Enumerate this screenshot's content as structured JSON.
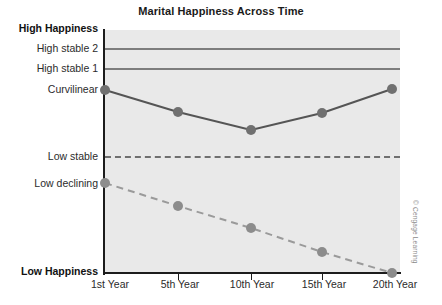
{
  "figure": {
    "title": "Marital Happiness Across Time",
    "credit": "© Cengage Learning"
  },
  "axes": {
    "y_top_label": "High Happiness",
    "y_bottom_label": "Low Happiness",
    "y_category_labels": [
      "High stable 2",
      "High stable 1",
      "Curvilinear",
      "Low stable",
      "Low declining"
    ],
    "x_tick_labels": [
      "1st Year",
      "5th Year",
      "10th Year",
      "15th Year",
      "20th Year"
    ]
  },
  "colors": {
    "plot_background": "#e9e9e9",
    "axis": "#1c1c1c",
    "flat_line": "#7d7d7d",
    "curvilinear_line": "#555555",
    "curvilinear_marker": "#707070",
    "declining_line": "#9a9a9a",
    "declining_marker": "#8c8c8c",
    "title_text": "#1a1a1a",
    "label_text": "#2b2b2b"
  },
  "chart_data": {
    "type": "line",
    "title": "Marital Happiness Across Time",
    "xlabel": "",
    "ylabel": "",
    "grid": false,
    "legend": "inline-left-axis",
    "x": [
      "1st Year",
      "5th Year",
      "10th Year",
      "15th Year",
      "20th Year"
    ],
    "ylim": [
      0,
      100
    ],
    "y_axis_anchors": [
      {
        "label": "High Happiness",
        "value": 100
      },
      {
        "label": "High stable 2",
        "value": 92
      },
      {
        "label": "High stable 1",
        "value": 84
      },
      {
        "label": "Curvilinear",
        "value": 75
      },
      {
        "label": "Low stable",
        "value": 47
      },
      {
        "label": "Low declining",
        "value": 37
      },
      {
        "label": "Low Happiness",
        "value": 0
      }
    ],
    "series": [
      {
        "name": "High stable 2",
        "style": "solid",
        "markers": false,
        "values": [
          92,
          92,
          92,
          92,
          92
        ]
      },
      {
        "name": "High stable 1",
        "style": "solid",
        "markers": false,
        "values": [
          84,
          84,
          84,
          84,
          84
        ]
      },
      {
        "name": "Curvilinear",
        "style": "solid",
        "markers": true,
        "values": [
          75,
          67,
          59,
          66,
          75
        ]
      },
      {
        "name": "Low stable",
        "style": "dashed",
        "markers": false,
        "values": [
          47,
          47,
          47,
          47,
          47
        ]
      },
      {
        "name": "Low declining",
        "style": "dashed",
        "markers": true,
        "values": [
          37,
          28,
          19,
          9,
          0
        ]
      }
    ]
  },
  "geometry": {
    "plot": {
      "left": 105,
      "top": 30,
      "right": 400,
      "bottom": 273
    },
    "x_pixels": [
      105,
      178,
      251,
      322,
      392
    ],
    "y_pixels": {
      "high_happiness": 30,
      "high_stable_2": 49,
      "high_stable_1": 69,
      "curvilinear": 90,
      "low_stable": 157,
      "low_declining": 183,
      "low_happiness": 273
    },
    "curvilinear_points": [
      [
        105,
        90
      ],
      [
        178,
        112
      ],
      [
        251,
        130
      ],
      [
        322,
        113
      ],
      [
        392,
        89
      ]
    ],
    "declining_points": [
      [
        105,
        183
      ],
      [
        178,
        206
      ],
      [
        251,
        228
      ],
      [
        322,
        252
      ],
      [
        392,
        273
      ]
    ]
  }
}
